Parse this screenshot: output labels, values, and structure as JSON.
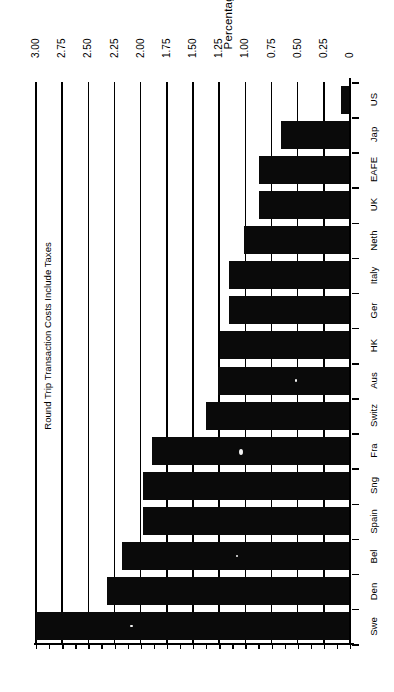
{
  "chart_data": {
    "type": "bar",
    "orientation": "horizontal",
    "title": "",
    "xlabel": "Percentage",
    "ylabel": "Round Trip Transaction Costs Include Taxes",
    "value_axis_label": "Percentage",
    "category_axis_label": "Round Trip Transaction Costs Include Taxes",
    "value_axis_reversed": true,
    "xlim": [
      0,
      3.0
    ],
    "grid": true,
    "legend": null,
    "tick_labels": [
      "3.00",
      "2.75",
      "2.50",
      "2.25",
      "2.00",
      "1.75",
      "1.50",
      "1.25",
      "1.00",
      "0.75",
      "0.50",
      "0.25",
      "0"
    ],
    "tick_values": [
      3.0,
      2.75,
      2.5,
      2.25,
      2.0,
      1.75,
      1.5,
      1.25,
      1.0,
      0.75,
      0.5,
      0.25,
      0
    ],
    "categories": [
      "US",
      "Jap",
      "EAFE",
      "UK",
      "Neth",
      "Italy",
      "Ger",
      "HK",
      "Aus",
      "Switz",
      "Fra",
      "Sng",
      "Spain",
      "Bel",
      "Den",
      "Swe"
    ],
    "values": [
      0.09,
      0.66,
      0.87,
      0.87,
      1.01,
      1.16,
      1.16,
      1.24,
      1.26,
      1.38,
      1.89,
      1.98,
      1.98,
      2.18,
      2.32,
      3.0
    ],
    "bar_color": "#0a0a0a",
    "background_color": "#ffffff"
  },
  "axis": {
    "title": "Percentage",
    "category_title": "Round Trip Transaction Costs Include Taxes"
  }
}
